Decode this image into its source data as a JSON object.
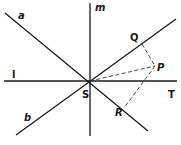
{
  "diagram": {
    "lines": [
      {
        "name": "a",
        "x1": 5,
        "y1": 13,
        "x2": 148,
        "y2": 131,
        "style": "solid"
      },
      {
        "name": "b",
        "x1": 16,
        "y1": 135,
        "x2": 176,
        "y2": 19,
        "style": "solid"
      },
      {
        "name": "m",
        "x1": 90,
        "y1": 3,
        "x2": 90,
        "y2": 136,
        "style": "solid"
      },
      {
        "name": "l",
        "x1": 4,
        "y1": 81,
        "x2": 177,
        "y2": 81,
        "style": "solid"
      }
    ],
    "dashed_segments": [
      {
        "name": "QP",
        "x1": 142,
        "y1": 44,
        "x2": 155,
        "y2": 66
      },
      {
        "name": "SP",
        "x1": 90,
        "y1": 81,
        "x2": 155,
        "y2": 66
      },
      {
        "name": "PR",
        "x1": 155,
        "y1": 66,
        "x2": 124,
        "y2": 108
      }
    ],
    "labels": {
      "a": "a",
      "b": "b",
      "m": "m",
      "l": "l",
      "S": "S",
      "T": "T",
      "P": "P",
      "Q": "Q",
      "R": "R"
    },
    "colors": {
      "line": "#1a1a1a",
      "background": "#ffffff"
    }
  }
}
